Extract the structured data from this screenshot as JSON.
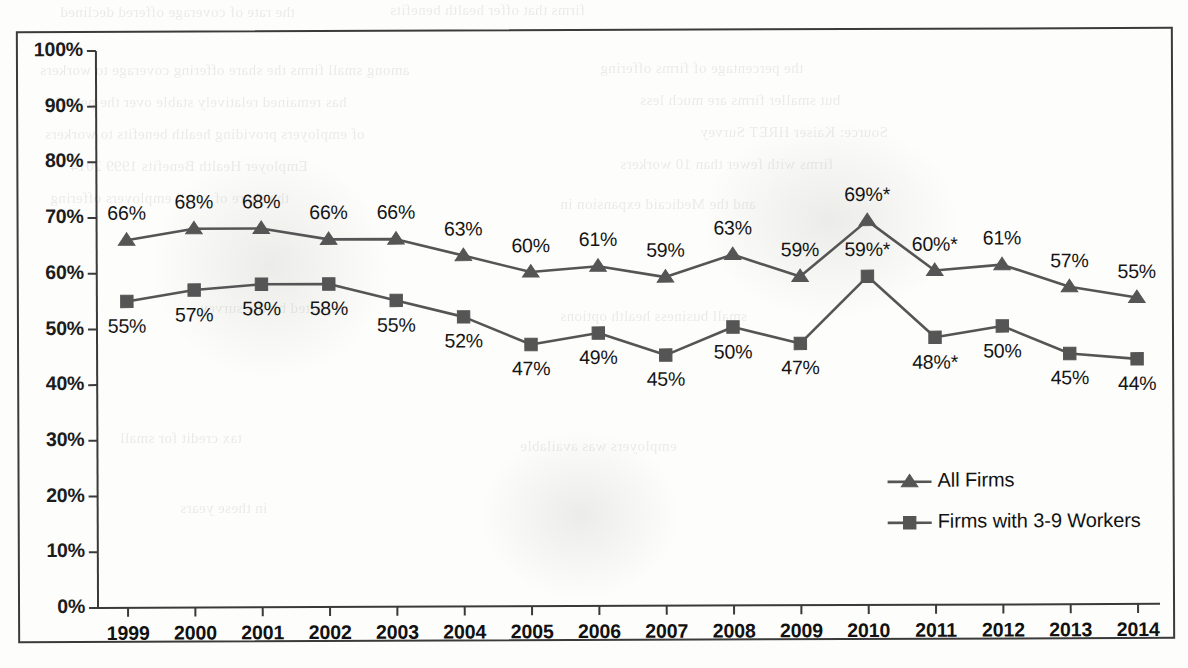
{
  "chart_data": {
    "type": "line",
    "title": "",
    "xlabel": "",
    "ylabel": "",
    "ylim": [
      0,
      100
    ],
    "grid": false,
    "legend_position": "inside-lower-right",
    "categories": [
      "1999",
      "2000",
      "2001",
      "2002",
      "2003",
      "2004",
      "2005",
      "2006",
      "2007",
      "2008",
      "2009",
      "2010",
      "2011",
      "2012",
      "2013",
      "2014"
    ],
    "ytick_labels": [
      "100%",
      "90%",
      "80%",
      "70%",
      "60%",
      "50%",
      "40%",
      "30%",
      "20%",
      "10%",
      "0%"
    ],
    "ytick_values": [
      100,
      90,
      80,
      70,
      60,
      50,
      40,
      30,
      20,
      10,
      0
    ],
    "series": [
      {
        "name": "All Firms",
        "marker": "triangle",
        "color": "#555555",
        "values": [
          66,
          68,
          68,
          66,
          66,
          63,
          60,
          61,
          59,
          63,
          59,
          69,
          60,
          61,
          57,
          55
        ],
        "point_labels": [
          "66%",
          "68%",
          "68%",
          "66%",
          "66%",
          "63%",
          "60%",
          "61%",
          "59%",
          "63%",
          "59%",
          "69%*",
          "60%*",
          "61%",
          "57%",
          "55%"
        ],
        "label_positions": [
          "above",
          "above",
          "above",
          "above",
          "above",
          "above",
          "above",
          "above",
          "above",
          "above",
          "above",
          "above",
          "above",
          "above",
          "above",
          "above"
        ]
      },
      {
        "name": "Firms with 3-9 Workers",
        "marker": "square",
        "color": "#555555",
        "values": [
          55,
          57,
          58,
          58,
          55,
          52,
          47,
          49,
          45,
          50,
          47,
          59,
          48,
          50,
          45,
          44
        ],
        "point_labels": [
          "55%",
          "57%",
          "58%",
          "58%",
          "55%",
          "52%",
          "47%",
          "49%",
          "45%",
          "50%",
          "47%",
          "59%*",
          "48%*",
          "50%",
          "45%",
          "44%"
        ],
        "label_positions": [
          "below",
          "below",
          "below",
          "below",
          "below",
          "below",
          "below",
          "below",
          "below",
          "below",
          "below",
          "above",
          "below",
          "below",
          "below",
          "below"
        ]
      }
    ],
    "legend": [
      {
        "label": "All Firms",
        "marker": "triangle"
      },
      {
        "label": "Firms with 3-9 Workers",
        "marker": "square"
      }
    ]
  },
  "bleed_text": {
    "lines": [
      "the rate of coverage offered declined",
      "firms that offer health benefits to their workers and",
      "among small firms the share offering coverage",
      "workers. The percentage of firms offering",
      "has remained relatively stable over the period",
      "but smaller firms are much less likely to offer",
      "of employers providing health benefits to",
      "Source: Kaiser/HRET Survey of Employer",
      "Health Benefits, 1999-2014"
    ]
  }
}
